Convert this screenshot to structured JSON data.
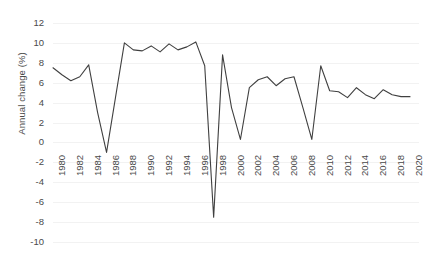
{
  "chart_data": {
    "type": "line",
    "title": "",
    "xlabel": "",
    "ylabel": "Annual change (%)",
    "ylim": [
      -10,
      12
    ],
    "xlim": [
      1980,
      2020
    ],
    "grid": true,
    "legend": "none",
    "y_ticks": [
      12,
      10,
      8,
      6,
      4,
      2,
      0,
      -2,
      -4,
      -6,
      -8,
      -10
    ],
    "y_tick_labels": [
      "12",
      "10",
      "8",
      "6",
      "4",
      "2",
      "0",
      "-2",
      "-4",
      "-6",
      "-8",
      "-10"
    ],
    "x_ticks": [
      1980,
      1982,
      1984,
      1986,
      1988,
      1990,
      1992,
      1994,
      1996,
      1998,
      2000,
      2002,
      2004,
      2006,
      2008,
      2010,
      2012,
      2014,
      2016,
      2018,
      2020
    ],
    "x_tick_labels": [
      "1980",
      "1982",
      "1984",
      "1986",
      "1988",
      "1990",
      "1992",
      "1994",
      "1996",
      "1998",
      "2000",
      "2002",
      "2004",
      "2006",
      "2008",
      "2010",
      "2012",
      "2014",
      "2016",
      "2018",
      "2020"
    ],
    "x": [
      1980,
      1981,
      1982,
      1983,
      1984,
      1985,
      1986,
      1987,
      1988,
      1989,
      1990,
      1991,
      1992,
      1993,
      1994,
      1995,
      1996,
      1997,
      1998,
      1999,
      2000,
      2001,
      2002,
      2003,
      2004,
      2005,
      2006,
      2007,
      2008,
      2009,
      2010,
      2011,
      2012,
      2013,
      2014,
      2015,
      2016,
      2017,
      2018,
      2019,
      2020
    ],
    "values": [
      7.5,
      6.8,
      6.2,
      6.6,
      7.8,
      3.0,
      -1.0,
      4.5,
      10.0,
      9.3,
      9.2,
      9.7,
      9.1,
      9.9,
      9.3,
      9.6,
      10.1,
      7.7,
      -7.5,
      8.8,
      3.5,
      0.3,
      5.5,
      6.3,
      6.6,
      5.7,
      6.4,
      6.6,
      3.5,
      0.3,
      7.7,
      5.2,
      5.1,
      4.5,
      5.5,
      4.8,
      4.4,
      5.3,
      4.8,
      4.6,
      4.6
    ],
    "series_name": "Annual change (%)",
    "line_color": "#404040",
    "grid_color": "#f2f2f2",
    "text_color": "#4a4a4a",
    "background_color": "#ffffff"
  }
}
